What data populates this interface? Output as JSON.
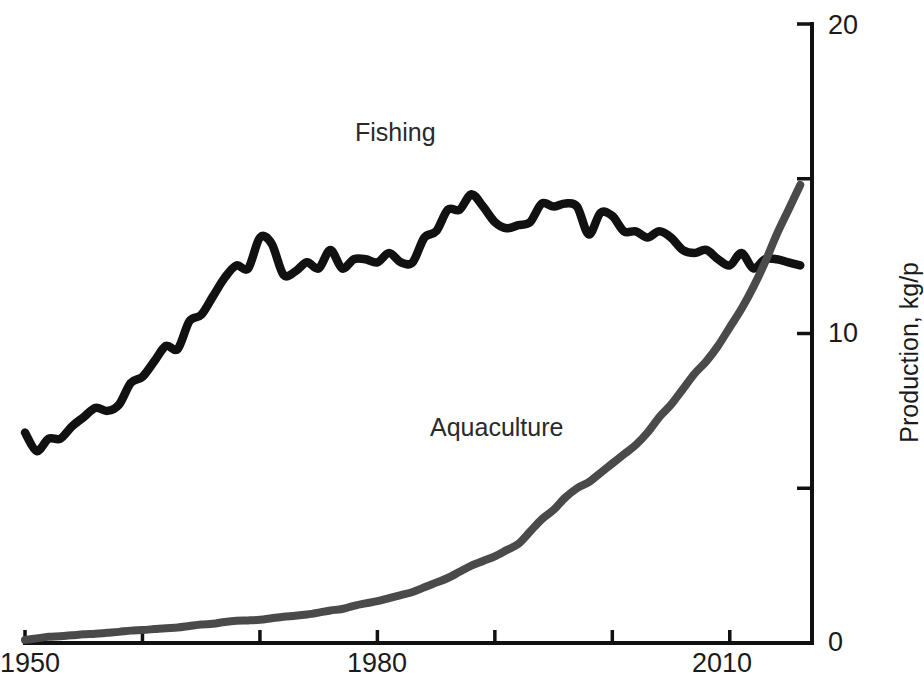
{
  "figure": {
    "background_color": "#ffffff",
    "width": 897,
    "height": 692
  },
  "axes": {
    "x": {
      "label": "",
      "tick_labels": [
        "1950",
        "1980",
        "2010"
      ],
      "tick_values": [
        1950,
        1980,
        2010
      ],
      "minor_tick_values": [
        1960,
        1970,
        1990,
        2000
      ],
      "range": [
        1950,
        2017
      ]
    },
    "y": {
      "title": "Production, kg/p",
      "tick_labels": [
        "0",
        "10",
        "20"
      ],
      "tick_values": [
        0,
        10,
        20
      ],
      "minor_tick_values": [
        5,
        15
      ],
      "range": [
        0,
        20
      ],
      "position": "right"
    }
  },
  "annotations": [
    {
      "name": "fishing-label",
      "text": "Fishing",
      "color": "#2a2a2a"
    },
    {
      "name": "aquaculture-label",
      "text": "Aquaculture",
      "color": "#2a2a2a"
    }
  ],
  "colors": {
    "fishing": "#111111",
    "aquaculture": "#4a4a4a",
    "axis": "#111111",
    "text": "#1b1b1b"
  },
  "chart_data": {
    "type": "line",
    "title": "",
    "xlabel": "",
    "ylabel": "Production, kg/p",
    "xlim": [
      1950,
      2017
    ],
    "ylim": [
      0,
      20
    ],
    "grid": false,
    "legend": "inline-labels",
    "x": [
      1950,
      1951,
      1952,
      1953,
      1954,
      1955,
      1956,
      1957,
      1958,
      1959,
      1960,
      1961,
      1962,
      1963,
      1964,
      1965,
      1966,
      1967,
      1968,
      1969,
      1970,
      1971,
      1972,
      1973,
      1974,
      1975,
      1976,
      1977,
      1978,
      1979,
      1980,
      1981,
      1982,
      1983,
      1984,
      1985,
      1986,
      1987,
      1988,
      1989,
      1990,
      1991,
      1992,
      1993,
      1994,
      1995,
      1996,
      1997,
      1998,
      1999,
      2000,
      2001,
      2002,
      2003,
      2004,
      2005,
      2006,
      2007,
      2008,
      2009,
      2010,
      2011,
      2012,
      2013,
      2014,
      2015,
      2016
    ],
    "series": [
      {
        "name": "Fishing",
        "color": "#111111",
        "values": [
          6.8,
          6.2,
          6.6,
          6.6,
          7.0,
          7.3,
          7.6,
          7.5,
          7.7,
          8.4,
          8.6,
          9.1,
          9.6,
          9.5,
          10.4,
          10.6,
          11.2,
          11.8,
          12.2,
          12.1,
          13.1,
          12.9,
          11.9,
          12.0,
          12.3,
          12.1,
          12.7,
          12.1,
          12.4,
          12.4,
          12.3,
          12.6,
          12.3,
          12.3,
          13.1,
          13.3,
          14.0,
          14.0,
          14.5,
          14.1,
          13.6,
          13.4,
          13.5,
          13.6,
          14.2,
          14.1,
          14.2,
          14.1,
          13.2,
          13.9,
          13.8,
          13.3,
          13.3,
          13.1,
          13.3,
          13.1,
          12.7,
          12.6,
          12.7,
          12.4,
          12.2,
          12.6,
          12.1,
          12.4,
          12.4,
          12.3,
          12.2
        ]
      },
      {
        "name": "Aquaculture",
        "color": "#4a4a4a",
        "values": [
          0.1,
          0.15,
          0.2,
          0.22,
          0.25,
          0.28,
          0.3,
          0.33,
          0.36,
          0.4,
          0.42,
          0.45,
          0.48,
          0.5,
          0.55,
          0.6,
          0.62,
          0.68,
          0.72,
          0.73,
          0.75,
          0.8,
          0.85,
          0.88,
          0.92,
          0.98,
          1.05,
          1.1,
          1.2,
          1.28,
          1.35,
          1.45,
          1.55,
          1.65,
          1.8,
          1.95,
          2.1,
          2.3,
          2.5,
          2.65,
          2.8,
          3.0,
          3.2,
          3.6,
          4.0,
          4.3,
          4.7,
          5.0,
          5.2,
          5.5,
          5.8,
          6.1,
          6.4,
          6.8,
          7.3,
          7.7,
          8.2,
          8.7,
          9.1,
          9.6,
          10.2,
          10.8,
          11.5,
          12.3,
          13.2,
          14.0,
          14.8
        ]
      }
    ]
  }
}
